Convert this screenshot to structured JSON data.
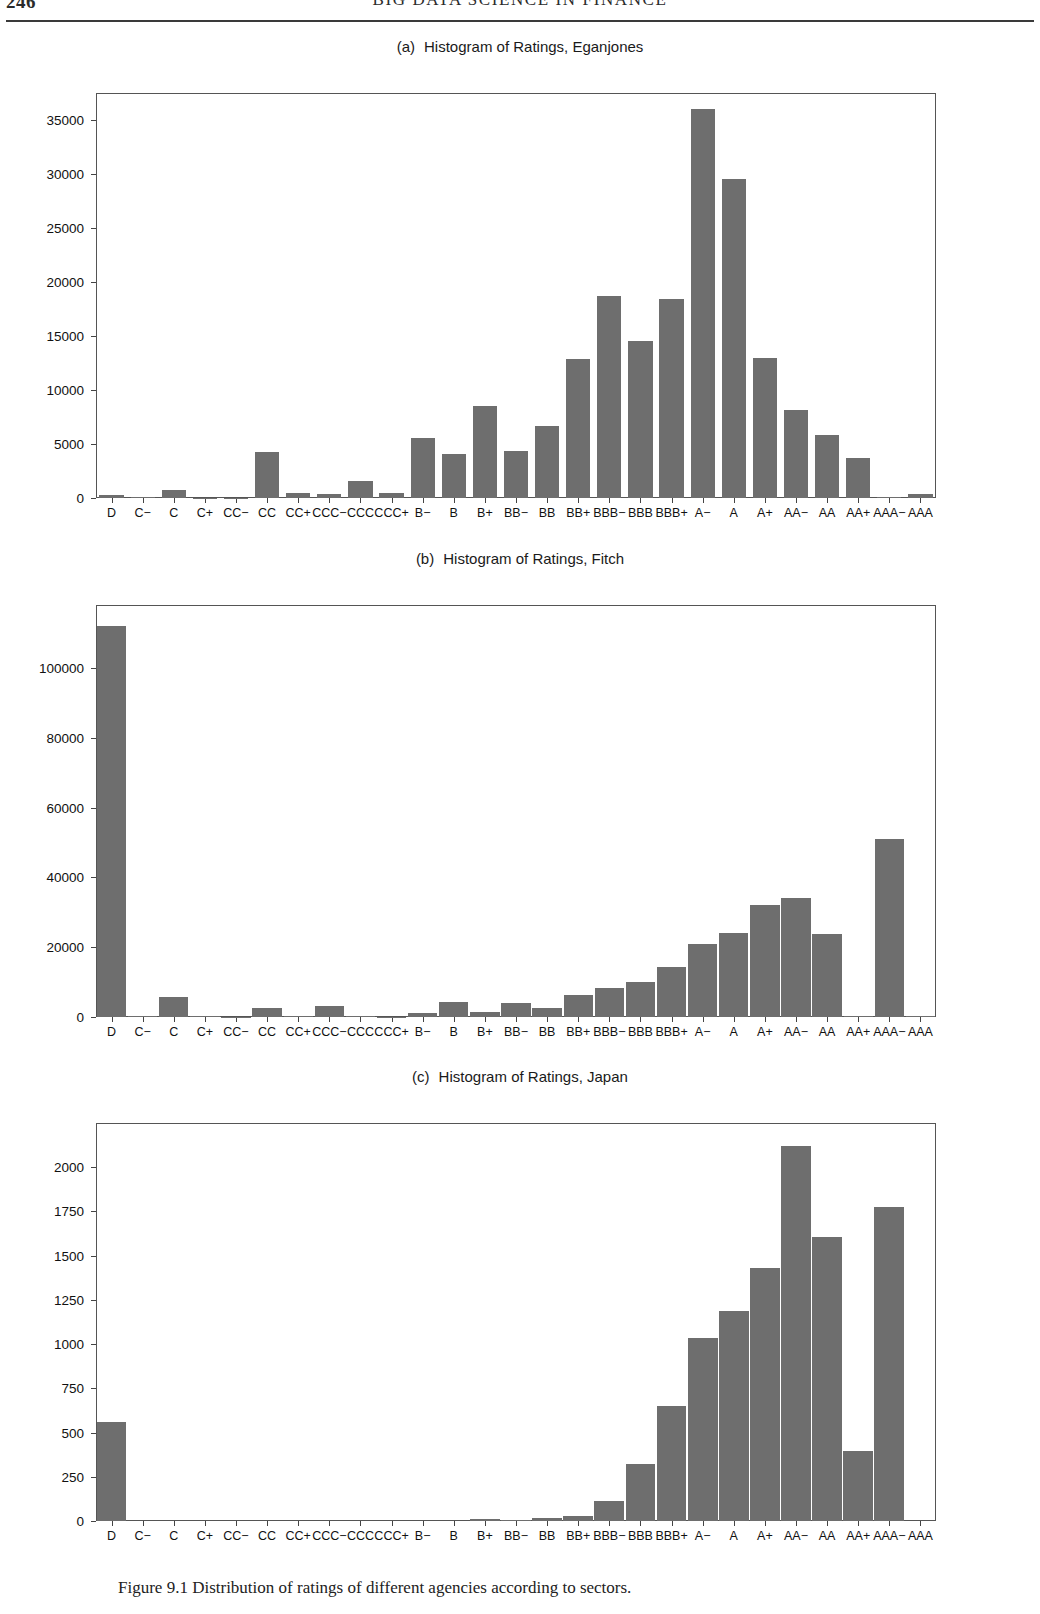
{
  "running_head": {
    "folio": "246",
    "title": "BIG DATA SCIENCE IN FINANCE"
  },
  "figure": {
    "caption_label": "Figure 9.1",
    "caption_text": "Distribution of ratings of different agencies according to sectors."
  },
  "panels": [
    {
      "tag": "(a)",
      "title": "Histogram of Ratings, Eganjones",
      "chart_key": "chart_a"
    },
    {
      "tag": "(b)",
      "title": "Histogram of Ratings, Fitch",
      "chart_key": "chart_b"
    },
    {
      "tag": "(c)",
      "title": "Histogram of Ratings, Japan",
      "chart_key": "chart_c"
    }
  ],
  "colors": {
    "bar_fill": "#6e6e6e",
    "axis": "#555555",
    "text": "#111111",
    "page_background": "#ffffff"
  },
  "chart_data": [
    {
      "id": "chart_a",
      "type": "bar",
      "title": "Histogram of Ratings, Eganjones",
      "panel_tag": "(a)",
      "xlabel": "",
      "ylabel": "",
      "grid": false,
      "legend": "none",
      "ylim": [
        0,
        37500
      ],
      "yticks": [
        0,
        5000,
        10000,
        15000,
        20000,
        25000,
        30000,
        35000
      ],
      "ytick_labels": [
        "0",
        "5000",
        "10000",
        "15000",
        "20000",
        "25000",
        "30000",
        "35000"
      ],
      "categories": [
        "D",
        "C−",
        "C",
        "C+",
        "CC−",
        "CC",
        "CC+",
        "CCC−",
        "CCC",
        "CCC+",
        "B−",
        "B",
        "B+",
        "BB−",
        "BB",
        "BB+",
        "BBB−",
        "BBB",
        "BBB+",
        "A−",
        "A",
        "A+",
        "AA−",
        "AA",
        "AA+",
        "AAA−",
        "AAA"
      ],
      "values": [
        250,
        60,
        750,
        40,
        30,
        4300,
        420,
        400,
        1600,
        450,
        5600,
        4100,
        8500,
        4350,
        6650,
        12900,
        18700,
        14500,
        18400,
        36000,
        29500,
        13000,
        8150,
        5800,
        3700,
        60,
        380
      ]
    },
    {
      "id": "chart_b",
      "type": "bar",
      "title": "Histogram of Ratings, Fitch",
      "panel_tag": "(b)",
      "xlabel": "",
      "ylabel": "",
      "grid": false,
      "legend": "none",
      "ylim": [
        0,
        118000
      ],
      "yticks": [
        0,
        20000,
        40000,
        60000,
        80000,
        100000
      ],
      "ytick_labels": [
        "0",
        "20000",
        "40000",
        "60000",
        "80000",
        "100000"
      ],
      "categories": [
        "D",
        "C−",
        "C",
        "C+",
        "CC−",
        "CC",
        "CC+",
        "CCC−",
        "CCC",
        "CCC+",
        "B−",
        "B",
        "B+",
        "BB−",
        "BB",
        "BB+",
        "BBB−",
        "BBB",
        "BBB+",
        "A−",
        "A",
        "A+",
        "AA−",
        "AA",
        "AA+",
        "AAA−",
        "AAA"
      ],
      "values": [
        112000,
        200,
        5800,
        150,
        120,
        2700,
        200,
        3200,
        150,
        120,
        1100,
        4300,
        1400,
        3900,
        2700,
        6300,
        8200,
        10000,
        14200,
        20800,
        24000,
        32000,
        34000,
        23800,
        150,
        51000,
        150
      ]
    },
    {
      "id": "chart_c",
      "type": "bar",
      "title": "Histogram of Ratings, Japan",
      "panel_tag": "(c)",
      "xlabel": "",
      "ylabel": "",
      "grid": false,
      "legend": "none",
      "ylim": [
        0,
        2250
      ],
      "yticks": [
        0,
        250,
        500,
        750,
        1000,
        1250,
        1500,
        1750,
        2000
      ],
      "ytick_labels": [
        "0",
        "250",
        "500",
        "750",
        "1000",
        "1250",
        "1500",
        "1750",
        "2000"
      ],
      "categories": [
        "D",
        "C−",
        "C",
        "C+",
        "CC−",
        "CC",
        "CC+",
        "CCC−",
        "CCC",
        "CCC+",
        "B−",
        "B",
        "B+",
        "BB−",
        "BB",
        "BB+",
        "BBB−",
        "BBB",
        "BBB+",
        "A−",
        "A",
        "A+",
        "AA−",
        "AA",
        "AA+",
        "AAA−",
        "AAA"
      ],
      "values": [
        560,
        0,
        0,
        0,
        0,
        0,
        0,
        0,
        0,
        0,
        0,
        0,
        10,
        5,
        15,
        30,
        115,
        320,
        650,
        1035,
        1190,
        1430,
        2120,
        1605,
        395,
        1775,
        0
      ]
    }
  ]
}
